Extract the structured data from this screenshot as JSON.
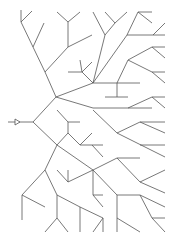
{
  "diagram": {
    "type": "branching-tree",
    "stroke": "#555555",
    "background": "#ffffff",
    "root_marker": "arrow-triangle",
    "segments": [
      [
        8,
        122,
        20,
        122
      ],
      [
        20,
        122,
        33,
        122
      ],
      [
        33,
        122,
        56,
        97
      ],
      [
        33,
        122,
        57,
        145
      ],
      [
        56,
        97,
        45,
        72
      ],
      [
        45,
        72,
        21,
        22
      ],
      [
        21,
        22,
        21,
        10
      ],
      [
        21,
        22,
        32,
        11
      ],
      [
        33,
        47,
        44,
        23
      ],
      [
        45,
        72,
        68,
        47
      ],
      [
        68,
        47,
        68,
        22
      ],
      [
        68,
        22,
        57,
        12
      ],
      [
        68,
        22,
        80,
        12
      ],
      [
        68,
        47,
        92,
        35
      ],
      [
        56,
        97,
        93,
        83
      ],
      [
        93,
        83,
        82,
        72
      ],
      [
        82,
        72,
        80,
        60
      ],
      [
        82,
        72,
        68,
        72
      ],
      [
        82,
        72,
        92,
        62
      ],
      [
        93,
        83,
        105,
        35
      ],
      [
        105,
        35,
        93,
        12
      ],
      [
        105,
        35,
        115,
        23
      ],
      [
        115,
        23,
        105,
        12
      ],
      [
        115,
        23,
        127,
        12
      ],
      [
        93,
        83,
        127,
        35
      ],
      [
        127,
        35,
        138,
        12
      ],
      [
        138,
        12,
        152,
        12
      ],
      [
        138,
        12,
        152,
        23
      ],
      [
        127,
        35,
        165,
        35
      ],
      [
        153,
        35,
        165,
        23
      ],
      [
        93,
        83,
        140,
        83
      ],
      [
        117,
        83,
        117,
        97
      ],
      [
        105,
        97,
        128,
        97
      ],
      [
        117,
        83,
        128,
        60
      ],
      [
        128,
        60,
        152,
        47
      ],
      [
        152,
        47,
        165,
        47
      ],
      [
        152,
        47,
        165,
        58
      ],
      [
        128,
        60,
        152,
        72
      ],
      [
        152,
        72,
        165,
        72
      ],
      [
        152,
        72,
        165,
        83
      ],
      [
        56,
        97,
        93,
        108
      ],
      [
        93,
        108,
        152,
        108
      ],
      [
        128,
        108,
        152,
        97
      ],
      [
        152,
        97,
        165,
        97
      ],
      [
        152,
        97,
        165,
        108
      ],
      [
        57,
        145,
        68,
        133
      ],
      [
        68,
        133,
        68,
        122
      ],
      [
        68,
        122,
        80,
        122
      ],
      [
        68,
        122,
        57,
        110
      ],
      [
        68,
        133,
        80,
        145
      ],
      [
        80,
        145,
        103,
        145
      ],
      [
        80,
        145,
        92,
        133
      ],
      [
        92,
        145,
        103,
        157
      ],
      [
        57,
        145,
        93,
        170
      ],
      [
        93,
        170,
        117,
        158
      ],
      [
        117,
        158,
        140,
        158
      ],
      [
        93,
        170,
        68,
        182
      ],
      [
        68,
        182,
        57,
        170
      ],
      [
        68,
        182,
        68,
        170
      ],
      [
        93,
        170,
        93,
        195
      ],
      [
        93,
        195,
        103,
        195
      ],
      [
        93,
        195,
        103,
        207
      ],
      [
        93,
        170,
        117,
        195
      ],
      [
        117,
        195,
        140,
        195
      ],
      [
        117,
        195,
        117,
        232
      ],
      [
        117,
        218,
        140,
        232
      ],
      [
        140,
        195,
        152,
        218
      ],
      [
        152,
        218,
        165,
        218
      ],
      [
        152,
        218,
        165,
        232
      ],
      [
        140,
        195,
        165,
        207
      ],
      [
        117,
        158,
        140,
        182
      ],
      [
        140,
        182,
        165,
        170
      ],
      [
        140,
        182,
        165,
        193
      ],
      [
        93,
        110,
        117,
        133
      ],
      [
        117,
        133,
        140,
        122
      ],
      [
        140,
        122,
        165,
        122
      ],
      [
        140,
        122,
        165,
        133
      ],
      [
        117,
        133,
        165,
        157
      ],
      [
        140,
        145,
        165,
        145
      ],
      [
        57,
        145,
        45,
        170
      ],
      [
        45,
        170,
        22,
        195
      ],
      [
        22,
        195,
        22,
        220
      ],
      [
        22,
        195,
        45,
        207
      ],
      [
        45,
        170,
        57,
        195
      ],
      [
        57,
        195,
        80,
        207
      ],
      [
        57,
        195,
        57,
        218
      ],
      [
        57,
        218,
        45,
        232
      ],
      [
        57,
        218,
        68,
        232
      ],
      [
        80,
        207,
        80,
        232
      ],
      [
        80,
        207,
        103,
        218
      ],
      [
        103,
        218,
        103,
        232
      ],
      [
        103,
        218,
        93,
        232
      ]
    ]
  }
}
